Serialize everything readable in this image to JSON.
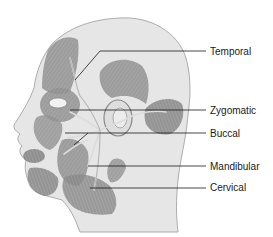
{
  "figure": {
    "colors": {
      "skin": "#e6e6e6",
      "outline": "#9a9a9a",
      "muscle": "#8f8f8f",
      "muscle_dark": "#6e6e6e",
      "nerve": "#d8d8d8",
      "leader": "#1a1a1a",
      "text": "#1a1a1a"
    }
  },
  "labels": [
    {
      "id": "temporal",
      "text": "Temporal",
      "y": 46
    },
    {
      "id": "zygomatic",
      "text": "Zygomatic",
      "y": 105
    },
    {
      "id": "buccal",
      "text": "Buccal",
      "y": 128
    },
    {
      "id": "mandibular",
      "text": "Mandibular",
      "y": 161
    },
    {
      "id": "cervical",
      "text": "Cervical",
      "y": 182
    }
  ]
}
